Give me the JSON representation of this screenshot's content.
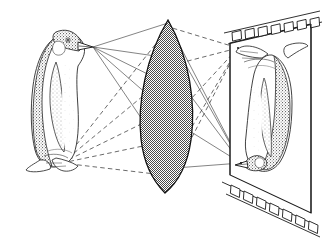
{
  "figure": {
    "title": "Lens imaging diagram: penguin photographed onto film",
    "background_color": "#ffffff",
    "ink_color": "#1a1a1a",
    "stipple_color": "#555555",
    "lens_fill_color": "#8c8c8c",
    "width": 331,
    "height": 238
  },
  "objects": {
    "subject": {
      "name": "penguin",
      "orientation": "upright",
      "facing": "right",
      "label": "Penguin (object)",
      "beak_tip": {
        "x": 93,
        "y": 47
      },
      "feet_point": {
        "x": 62,
        "y": 163
      },
      "body_center": {
        "x": 58,
        "y": 105
      }
    },
    "lens": {
      "name": "biconvex-lens",
      "label": "Convex lens",
      "shape": "biconvex",
      "fill": "checkered-halftone-gray",
      "top_vertex": {
        "x": 168,
        "y": 20
      },
      "bottom_vertex": {
        "x": 165,
        "y": 193
      },
      "max_half_width": 30,
      "center": {
        "x": 166,
        "y": 106
      }
    },
    "film": {
      "name": "film-plane",
      "label": "Film",
      "sprocket_holes_top": 7,
      "sprocket_holes_bottom": 7,
      "frame_corners": {
        "top_left": {
          "x": 229,
          "y": 42
        },
        "top_right": {
          "x": 313,
          "y": 23
        },
        "bottom_right": {
          "x": 313,
          "y": 216
        },
        "bottom_left": {
          "x": 229,
          "y": 176
        }
      }
    },
    "image": {
      "name": "inverted-penguin-image",
      "label": "Inverted image on film",
      "orientation": "inverted",
      "beak_tip": {
        "x": 241,
        "y": 163
      },
      "feet_point": {
        "x": 238,
        "y": 48
      }
    }
  },
  "rays": {
    "solid": {
      "label": "Rays from beak",
      "style": "solid",
      "from": {
        "x": 93,
        "y": 47
      },
      "to": {
        "x": 241,
        "y": 163
      },
      "lens_hit_points": [
        {
          "x": 168,
          "y": 23
        },
        {
          "x": 183,
          "y": 60
        },
        {
          "x": 190,
          "y": 95
        },
        {
          "x": 188,
          "y": 130
        },
        {
          "x": 175,
          "y": 168
        }
      ]
    },
    "dashed": {
      "label": "Rays from feet",
      "style": "dashed",
      "from": {
        "x": 62,
        "y": 163
      },
      "to": {
        "x": 238,
        "y": 48
      },
      "lens_hit_points": [
        {
          "x": 169,
          "y": 27
        },
        {
          "x": 184,
          "y": 62
        },
        {
          "x": 190,
          "y": 100
        },
        {
          "x": 186,
          "y": 137
        },
        {
          "x": 172,
          "y": 176
        }
      ]
    }
  },
  "annotations": {
    "visible_text": []
  }
}
